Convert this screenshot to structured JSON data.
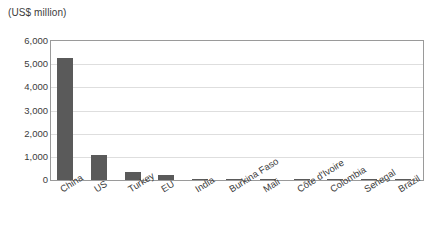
{
  "chart_data": {
    "type": "bar",
    "title": "(US$ million)",
    "xlabel": "",
    "ylabel": "(US$ million)",
    "categories": [
      "China",
      "US",
      "Turkey",
      "EU",
      "India",
      "Burkina Faso",
      "Mali",
      "Côte d'Ivoire",
      "Colombia",
      "Senegal",
      "Brazil"
    ],
    "values": [
      5250,
      1070,
      350,
      220,
      60,
      45,
      20,
      15,
      10,
      8,
      5
    ],
    "ylim": [
      0,
      6000
    ],
    "yticks": [
      0,
      1000,
      2000,
      3000,
      4000,
      5000,
      6000
    ],
    "ytick_labels": [
      "0",
      "1,000",
      "2,000",
      "3,000",
      "4,000",
      "5,000",
      "6,000"
    ],
    "grid": true,
    "legend": false,
    "bar_color": "#5a5a5a",
    "grid_color": "#dedede",
    "frame_color": "#9a9a9a"
  }
}
